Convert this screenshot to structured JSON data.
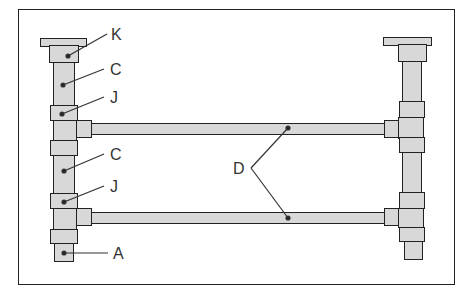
{
  "diagram": {
    "type": "pipe-frame assembly",
    "labels": {
      "K": "K",
      "C1": "C",
      "J1": "J",
      "C2": "C",
      "J2": "J",
      "A": "A",
      "D": "D"
    },
    "colors": {
      "pipe_fill": "#d8d8d8",
      "outline": "#222222",
      "background": "#ffffff"
    }
  }
}
